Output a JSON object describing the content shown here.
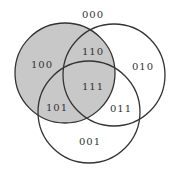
{
  "diagram": {
    "type": "venn-3",
    "shaded_region": "circle A (left)",
    "colors": {
      "shade": "#c8c8c8",
      "stroke": "#333333",
      "background": "#ffffff"
    },
    "circles": [
      {
        "id": "A",
        "cx": 65,
        "cy": 73,
        "r": 50,
        "shaded": true
      },
      {
        "id": "B",
        "cx": 114,
        "cy": 75,
        "r": 51,
        "shaded": false
      },
      {
        "id": "C",
        "cx": 89,
        "cy": 112,
        "r": 51,
        "shaded": false
      }
    ],
    "labels": {
      "l000": "000",
      "l100": "100",
      "l110": "110",
      "l010": "010",
      "l111": "111",
      "l101": "101",
      "l011": "011",
      "l001": "001"
    }
  }
}
